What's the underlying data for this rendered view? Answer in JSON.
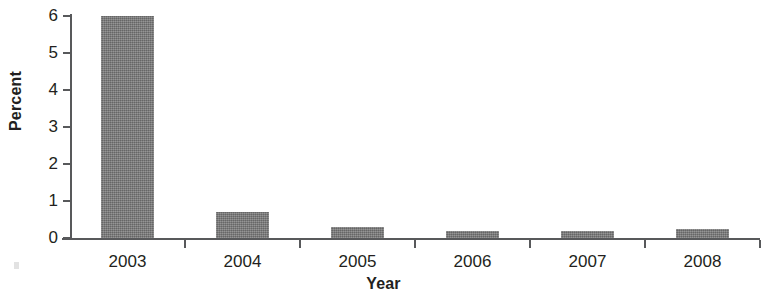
{
  "chart_data": {
    "type": "bar",
    "title": "",
    "subtitle": "",
    "xlabel": "Year",
    "ylabel": "Percent",
    "categories": [
      "2003",
      "2004",
      "2005",
      "2006",
      "2007",
      "2008"
    ],
    "values": [
      6.0,
      0.7,
      0.3,
      0.2,
      0.2,
      0.25
    ],
    "ylim": [
      0,
      6
    ],
    "ytick_labels": [
      "0",
      "1",
      "2",
      "3",
      "4",
      "5",
      "6"
    ],
    "ytick_values": [
      0,
      1,
      2,
      3,
      4,
      5,
      6
    ],
    "grid": false,
    "legend": null,
    "legend_position": "none",
    "bar_color": "#7d7d7d",
    "axis_color": "#58595b",
    "text_color": "#231f20",
    "background_color": "#ffffff",
    "annotations": []
  }
}
